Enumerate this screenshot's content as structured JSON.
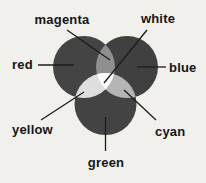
{
  "diagram": {
    "type": "additive-color-mixing-venn",
    "labels": {
      "magenta": "magenta",
      "white": "white",
      "red": "red",
      "blue": "blue",
      "yellow": "yellow",
      "cyan": "cyan",
      "green": "green"
    },
    "colors": {
      "paper": "#f1f0ed",
      "red_circle": "#444444",
      "blue_circle": "#404040",
      "green_circle": "#434343",
      "magenta_overlap": "#8f8f8f",
      "cyan_overlap": "#b5b5b5",
      "yellow_overlap": "#dedede",
      "white_center": "#fbfbfa",
      "line": "#1c1c1c",
      "text": "#161616"
    }
  }
}
